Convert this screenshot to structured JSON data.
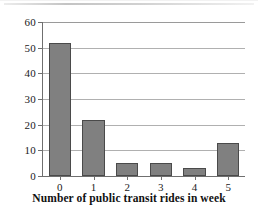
{
  "chart_data": {
    "type": "bar",
    "title": "",
    "subtitle": "",
    "categories": [
      "0",
      "1",
      "2",
      "3",
      "4",
      "5"
    ],
    "values": [
      52,
      22,
      5,
      5,
      3,
      13
    ],
    "xlabel": "Number of public transit rides in week",
    "ylabel": "Relative frequency (%)",
    "ylim": [
      0,
      60
    ],
    "ytick_labels": [
      "0",
      "10",
      "20",
      "30",
      "40",
      "50",
      "60"
    ],
    "ytick_values": [
      0,
      10,
      20,
      30,
      40,
      50,
      60
    ],
    "grid": "horizontal",
    "legend": "none",
    "bar_color": "#808080",
    "bar_edge_color": "#4a4a4a",
    "grid_color": "#b0b0b0",
    "axis_color": "#6f6f6f",
    "background_color": "#ffffff"
  }
}
